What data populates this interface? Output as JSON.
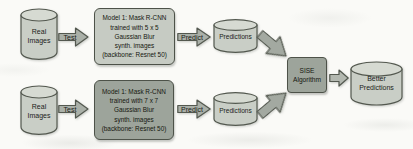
{
  "colors": {
    "background": "#fafaf7",
    "outline": "#53584f",
    "cylinder_fill": "#c9cec6",
    "cylinder_top_fill": "#d6dad2",
    "model_box_top_fill": "#c6cbc3",
    "model_box_bottom_fill": "#9da49b",
    "sise_box_fill": "#9da49b",
    "arrow_fill": "#aab0a8",
    "diag_arrow_fill": "#a3a9a1",
    "small_arrow_fill": "#b3b8b0",
    "text": "#1b1d1a"
  },
  "pipelines": {
    "top": {
      "source": "Real Images",
      "test": "Test",
      "model": {
        "lines": [
          "Model 1: Mask R-CNN",
          "trained with 5 x 5",
          "Gaussian Blur",
          "synth. images",
          "(backbone: Resnet 50)"
        ]
      },
      "predict": "Predict",
      "output": "Predictions"
    },
    "bottom": {
      "source": "Real Images",
      "test": "Test",
      "model": {
        "lines": [
          "Model 1: Mask R-CNN",
          "trained with 7 x 7",
          "Gaussian Blur",
          "synth. images",
          "(backbone: Resnet 50)"
        ]
      },
      "predict": "Predict",
      "output": "Predictions"
    }
  },
  "ensemble": {
    "algorithm": "SISE Algorithm",
    "output": "Better Predictions"
  }
}
